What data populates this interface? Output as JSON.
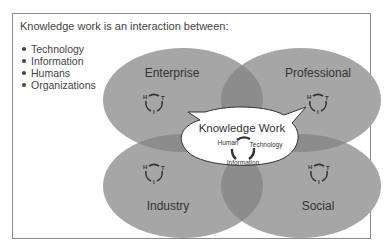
{
  "headline": "Knowledge work is an interaction between:",
  "bullets": [
    "Technology",
    "Information",
    "Humans",
    "Organizations"
  ],
  "quadrants": {
    "top_left": {
      "label": "Enterprise"
    },
    "top_right": {
      "label": "Professional"
    },
    "bottom_left": {
      "label": "Industry"
    },
    "bottom_right": {
      "label": "Social"
    }
  },
  "cycle_letters": {
    "h": "H",
    "t": "T",
    "i": "I"
  },
  "center": {
    "title": "Knowledge Work",
    "human": "Human",
    "technology": "Technology",
    "information": "Information"
  },
  "colors": {
    "ellipse": "#a6a6a6",
    "overlap": "#8c8c8c",
    "bubble": "#ffffff",
    "frame": "#8a8a8a"
  }
}
